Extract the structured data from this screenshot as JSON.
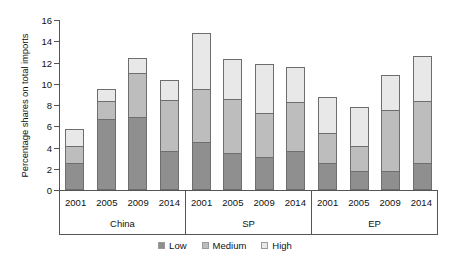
{
  "chart_data": {
    "type": "bar",
    "subtype": "stacked-bar-grouped",
    "title": "",
    "xlabel": "",
    "ylabel": "Percentage shares on total imports",
    "ylim": [
      0,
      16
    ],
    "ytick_labels": [
      "0",
      "2",
      "4",
      "6",
      "8",
      "10",
      "12",
      "14",
      "16"
    ],
    "ytick_values": [
      0,
      2,
      4,
      6,
      8,
      10,
      12,
      14,
      16
    ],
    "grid": false,
    "legend_position": "bottom-center",
    "legend": [
      "Low",
      "Medium",
      "High"
    ],
    "series": [
      {
        "name": "Low",
        "color": "#8f8f8f",
        "values": [
          2.55,
          6.7,
          6.9,
          3.7,
          4.55,
          3.5,
          3.15,
          3.7,
          2.55,
          1.75,
          1.8,
          2.5
        ]
      },
      {
        "name": "Medium",
        "color": "#bdbdbd",
        "values": [
          1.55,
          1.7,
          4.15,
          4.75,
          4.95,
          5.05,
          4.1,
          4.55,
          2.8,
          2.4,
          5.7,
          5.85
        ]
      },
      {
        "name": "High",
        "color": "#e8e8e8",
        "values": [
          1.65,
          1.1,
          1.4,
          1.95,
          5.25,
          3.8,
          4.6,
          3.3,
          3.45,
          3.65,
          3.35,
          4.3
        ]
      }
    ],
    "totals": [
      5.75,
      9.5,
      12.45,
      10.4,
      14.75,
      12.35,
      11.85,
      11.55,
      8.8,
      7.8,
      10.85,
      12.65
    ],
    "groups": [
      {
        "name": "China",
        "categories": [
          "2001",
          "2005",
          "2009",
          "2014"
        ]
      },
      {
        "name": "SP",
        "categories": [
          "2001",
          "2005",
          "2009",
          "2014"
        ]
      },
      {
        "name": "EP",
        "categories": [
          "2001",
          "2005",
          "2009",
          "2014"
        ]
      }
    ],
    "categories": [
      "2001",
      "2005",
      "2009",
      "2014",
      "2001",
      "2005",
      "2009",
      "2014",
      "2001",
      "2005",
      "2009",
      "2014"
    ]
  },
  "colors": {
    "low": "#8f8f8f",
    "medium": "#bdbdbd",
    "high": "#e8e8e8",
    "axis": "#555555",
    "background": "#ffffff"
  }
}
